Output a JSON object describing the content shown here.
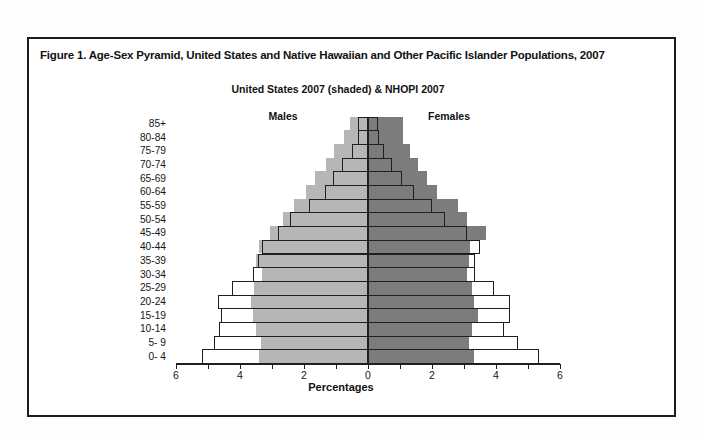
{
  "figure": {
    "title": "Figure 1. Age-Sex Pyramid, United States and Native Hawaiian and Other Pacific Islander Populations, 2007",
    "subtitle": "United States 2007 (shaded) & NHOPI 2007",
    "left_header": "Males",
    "right_header": "Females",
    "xlabel": "Percentages"
  },
  "colors": {
    "us_male_shade": "#b6b6b6",
    "us_female_shade": "#7c7c7c",
    "nhopi_outline": "#1f1f1f",
    "frame_border": "#1c1c1c",
    "text": "#121212"
  },
  "chart_data": {
    "type": "bar",
    "variant": "population-pyramid",
    "title": "Figure 1. Age-Sex Pyramid, United States and Native Hawaiian and Other Pacific Islander Populations, 2007",
    "subtitle": "United States 2007 (shaded) & NHOPI 2007",
    "xlabel": "Percentages",
    "legend_note": "United States 2007 drawn as shaded bars; NHOPI 2007 drawn as outlined (unfilled) bars",
    "age_groups_top_to_bottom": [
      "85+",
      "80-84",
      "75-79",
      "70-74",
      "65-69",
      "60-64",
      "55-59",
      "50-54",
      "45-49",
      "40-44",
      "35-39",
      "30-34",
      "25-29",
      "20-24",
      "15-19",
      "10-14",
      "5- 9",
      "0- 4"
    ],
    "axis": {
      "unit": "percent of total population",
      "xlim_each_side": [
        0,
        6
      ],
      "tick_label_values": [
        6,
        4,
        2,
        0,
        2,
        4,
        6
      ],
      "tick_label_positions": [
        -6,
        -4,
        -2,
        0,
        2,
        4,
        6
      ],
      "minor_tick_step": 1,
      "grid": false
    },
    "series": [
      {
        "name": "United States 2007 Males (shaded)",
        "style": "shaded",
        "side": "left",
        "color": "#b6b6b6",
        "values_top_to_bottom": [
          0.55,
          0.75,
          1.05,
          1.3,
          1.65,
          1.95,
          2.3,
          2.65,
          3.05,
          3.4,
          3.5,
          3.3,
          3.55,
          3.65,
          3.6,
          3.5,
          3.35,
          3.4
        ]
      },
      {
        "name": "United States 2007 Females (shaded)",
        "style": "shaded",
        "side": "right",
        "color": "#7c7c7c",
        "values_top_to_bottom": [
          1.1,
          1.1,
          1.3,
          1.55,
          1.85,
          2.15,
          2.8,
          3.1,
          3.7,
          3.2,
          3.15,
          3.1,
          3.25,
          3.3,
          3.45,
          3.25,
          3.15,
          3.3
        ]
      },
      {
        "name": "NHOPI 2007 Males (outline)",
        "style": "outline",
        "side": "left",
        "color": "#1f1f1f",
        "values_top_to_bottom": [
          0.3,
          0.3,
          0.5,
          0.8,
          1.1,
          1.35,
          1.85,
          2.45,
          2.8,
          3.3,
          3.45,
          3.6,
          4.25,
          4.7,
          4.6,
          4.65,
          4.8,
          5.2
        ]
      },
      {
        "name": "NHOPI 2007 Females (outline)",
        "style": "outline",
        "side": "right",
        "color": "#1f1f1f",
        "values_top_to_bottom": [
          0.3,
          0.35,
          0.5,
          0.75,
          1.05,
          1.45,
          2.0,
          2.4,
          3.1,
          3.5,
          3.35,
          3.35,
          3.95,
          4.45,
          4.45,
          4.25,
          4.7,
          5.35
        ]
      }
    ]
  }
}
